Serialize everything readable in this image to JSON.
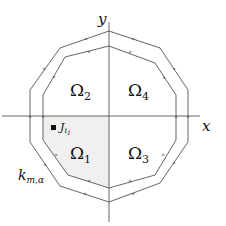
{
  "axes": {
    "x_label": "x",
    "y_label": "y",
    "origin": [
      109,
      116
    ]
  },
  "regions": [
    {
      "name": "Ω",
      "sub": "1",
      "x": 70,
      "y": 160,
      "shaded": true
    },
    {
      "name": "Ω",
      "sub": "2",
      "x": 70,
      "y": 80,
      "shaded": false
    },
    {
      "name": "Ω",
      "sub": "3",
      "x": 128,
      "y": 160,
      "shaded": false
    },
    {
      "name": "Ω",
      "sub": "4",
      "x": 128,
      "y": 80,
      "shaded": false
    }
  ],
  "point_label": {
    "name": "J",
    "sub": "i",
    "subsub": "1"
  },
  "curve_label": {
    "name": "k",
    "sub": "m,α"
  },
  "colors": {
    "line": "#555555",
    "shade": "#f0f0f0",
    "text": "#111111"
  }
}
